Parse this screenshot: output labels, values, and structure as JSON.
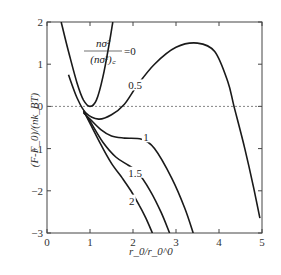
{
  "chart_data": {
    "type": "line",
    "title": "",
    "xlabel": "r_0/r_0^0",
    "ylabel": "(F-F_0)/(nk_BT)",
    "xlim": [
      0,
      5
    ],
    "ylim": [
      -3,
      2
    ],
    "xticks": [
      "0",
      "1",
      "2",
      "3",
      "4",
      "5"
    ],
    "yticks": [
      "2",
      "1",
      "0",
      "-1",
      "-2",
      "-3"
    ],
    "grid": false,
    "reference_line": {
      "y": 0,
      "style": "dashed"
    },
    "legend_title": "nσ²/(nσ²)_c",
    "series": [
      {
        "name": "0",
        "label": "=0",
        "points": [
          [
            0.33,
            2.0
          ],
          [
            0.5,
            1.3
          ],
          [
            0.7,
            0.55
          ],
          [
            0.85,
            0.15
          ],
          [
            1.0,
            0.0
          ],
          [
            1.15,
            0.15
          ],
          [
            1.3,
            0.7
          ],
          [
            1.45,
            1.5
          ],
          [
            1.53,
            2.0
          ]
        ]
      },
      {
        "name": "0.5",
        "label": "0.5",
        "points": [
          [
            0.5,
            0.75
          ],
          [
            0.7,
            0.2
          ],
          [
            0.9,
            -0.15
          ],
          [
            1.2,
            -0.3
          ],
          [
            1.5,
            -0.2
          ],
          [
            1.8,
            0.05
          ],
          [
            2.1,
            0.5
          ],
          [
            2.5,
            1.0
          ],
          [
            3.0,
            1.4
          ],
          [
            3.5,
            1.5
          ],
          [
            3.9,
            1.3
          ],
          [
            4.2,
            0.6
          ],
          [
            4.35,
            0.0
          ],
          [
            4.6,
            -1.0
          ],
          [
            4.8,
            -1.9
          ],
          [
            4.95,
            -2.65
          ]
        ]
      },
      {
        "name": "1",
        "label": "1",
        "points": [
          [
            0.85,
            -0.15
          ],
          [
            1.0,
            -0.3
          ],
          [
            1.25,
            -0.55
          ],
          [
            1.5,
            -0.7
          ],
          [
            1.8,
            -0.75
          ],
          [
            2.2,
            -0.78
          ],
          [
            2.5,
            -1.0
          ],
          [
            2.9,
            -1.7
          ],
          [
            3.2,
            -2.4
          ],
          [
            3.4,
            -3.0
          ]
        ]
      },
      {
        "name": "1.5",
        "label": "1.5",
        "points": [
          [
            0.85,
            -0.12
          ],
          [
            1.0,
            -0.35
          ],
          [
            1.3,
            -0.85
          ],
          [
            1.6,
            -1.2
          ],
          [
            1.9,
            -1.4
          ],
          [
            2.1,
            -1.55
          ],
          [
            2.4,
            -2.0
          ],
          [
            2.65,
            -2.5
          ],
          [
            2.85,
            -3.0
          ]
        ]
      },
      {
        "name": "2",
        "label": "2",
        "points": [
          [
            0.85,
            -0.1
          ],
          [
            1.0,
            -0.4
          ],
          [
            1.25,
            -0.9
          ],
          [
            1.5,
            -1.35
          ],
          [
            1.75,
            -1.7
          ],
          [
            1.95,
            -2.0
          ],
          [
            2.15,
            -2.35
          ],
          [
            2.3,
            -2.65
          ],
          [
            2.45,
            -3.0
          ]
        ]
      }
    ],
    "annotations": [
      {
        "text": "0.5",
        "x": 2.05,
        "y": 0.45
      },
      {
        "text": "1",
        "x": 2.3,
        "y": -0.78
      },
      {
        "text": "1.5",
        "x": 2.05,
        "y": -1.62
      },
      {
        "text": "2",
        "x": 1.97,
        "y": -2.28
      }
    ]
  }
}
